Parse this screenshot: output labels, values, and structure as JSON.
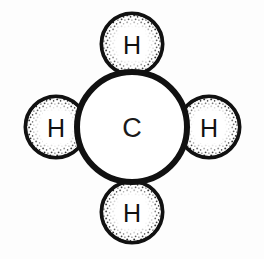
{
  "figure": {
    "name": "methane-molecule-diagram",
    "formula": "CH4",
    "background_color": "#fdfdfd",
    "outline_color": "#111111",
    "fill_color": "#ffffff",
    "stipple_color": "#2b2b2b"
  },
  "atoms": {
    "center": {
      "label": "C",
      "element_name": "carbon",
      "cx": 132,
      "cy": 127,
      "r": 55,
      "stroke_width": 6
    },
    "hydrogens": [
      {
        "label": "H",
        "element_name": "hydrogen",
        "position": "top",
        "cx": 132,
        "cy": 44,
        "r": 30,
        "stroke_width": 5
      },
      {
        "label": "H",
        "element_name": "hydrogen",
        "position": "left",
        "cx": 56,
        "cy": 127,
        "r": 30,
        "stroke_width": 5
      },
      {
        "label": "H",
        "element_name": "hydrogen",
        "position": "right",
        "cx": 209,
        "cy": 127,
        "r": 30,
        "stroke_width": 5
      },
      {
        "label": "H",
        "element_name": "hydrogen",
        "position": "bottom",
        "cx": 132,
        "cy": 212,
        "r": 30,
        "stroke_width": 5
      }
    ]
  }
}
